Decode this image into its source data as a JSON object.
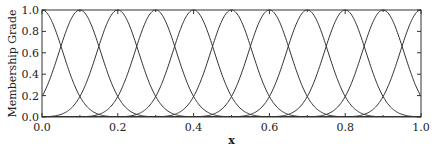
{
  "chart_data": {
    "type": "line",
    "title": "",
    "xlabel": "x",
    "ylabel": "Membership Grade",
    "xlim": [
      0.0,
      1.0
    ],
    "ylim": [
      0.0,
      1.0
    ],
    "x_ticks": [
      "0.0",
      "0.2",
      "0.4",
      "0.6",
      "0.8",
      "1.0"
    ],
    "y_ticks": [
      "0.0",
      "0.2",
      "0.4",
      "0.6",
      "0.8",
      "1.0"
    ],
    "grid": false,
    "legend": null,
    "series_description": "11 Gaussian membership functions, peak 1.0, adjacent curves crossing at ~0.65",
    "gaussian_sigma": 0.055,
    "series": [
      {
        "name": "MF1",
        "center": 0.0
      },
      {
        "name": "MF2",
        "center": 0.1
      },
      {
        "name": "MF3",
        "center": 0.2
      },
      {
        "name": "MF4",
        "center": 0.3
      },
      {
        "name": "MF5",
        "center": 0.4
      },
      {
        "name": "MF6",
        "center": 0.5
      },
      {
        "name": "MF7",
        "center": 0.6
      },
      {
        "name": "MF8",
        "center": 0.7
      },
      {
        "name": "MF9",
        "center": 0.8
      },
      {
        "name": "MF10",
        "center": 0.9
      },
      {
        "name": "MF11",
        "center": 1.0
      }
    ],
    "colors": {
      "line": "#333333",
      "axis": "#333333"
    }
  }
}
